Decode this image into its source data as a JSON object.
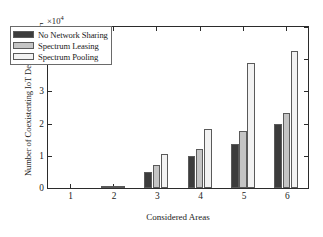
{
  "chart_data": {
    "type": "bar",
    "title": "",
    "xlabel": "Considered Areas",
    "ylabel": "Number of Coexistenting IoT Devices",
    "y_exponent_label": "×10",
    "y_exponent_power": "4",
    "y_scale": 10000,
    "categories": [
      "1",
      "2",
      "3",
      "4",
      "5",
      "6"
    ],
    "ylim": [
      0,
      50000
    ],
    "yticks": [
      "0",
      "1",
      "2",
      "3",
      "4",
      "5"
    ],
    "ytick_values": [
      0,
      10000,
      20000,
      30000,
      40000,
      50000
    ],
    "grid": false,
    "legend_position": "upper left",
    "series": [
      {
        "name": "No Network Sharing",
        "color": "#3c3c3c",
        "values": [
          0,
          200,
          5100,
          9900,
          13800,
          19900
        ]
      },
      {
        "name": "Spectrum Leasing",
        "color": "#c4c4c4",
        "values": [
          0,
          300,
          7100,
          12100,
          17800,
          23400
        ]
      },
      {
        "name": "Spectrum Pooling",
        "color": "#f2f2f2",
        "values": [
          0,
          400,
          10500,
          18200,
          38700,
          42500
        ]
      }
    ]
  },
  "axes": {
    "y_title": "Number of Coexistenting IoT Devices",
    "x_title": "Considered Areas"
  },
  "legend": {
    "entries": [
      {
        "label": "No Network Sharing",
        "color": "#3c3c3c"
      },
      {
        "label": "Spectrum Leasing",
        "color": "#c4c4c4"
      },
      {
        "label": "Spectrum Pooling",
        "color": "#f2f2f2"
      }
    ]
  }
}
